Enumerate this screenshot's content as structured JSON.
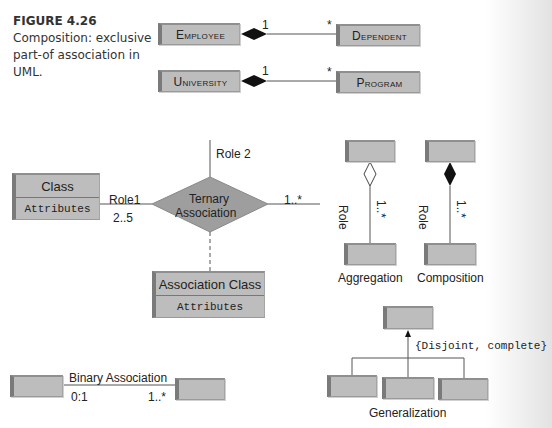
{
  "caption": {
    "figure_label": "FIGURE 4.26",
    "text": "Composition: exclusive part-of association in UML."
  },
  "composition_examples": [
    {
      "whole": "Employee",
      "part": "Dependent",
      "whole_mult": "1",
      "part_mult": "*"
    },
    {
      "whole": "University",
      "part": "Program",
      "whole_mult": "1",
      "part_mult": "*"
    }
  ],
  "ternary": {
    "class_name": "Class",
    "class_attrs": "Attributes",
    "role1": "Role1",
    "role1_mult": "2..5",
    "role2": "Role 2",
    "diamond_label_1": "Ternary",
    "diamond_label_2": "Association",
    "right_mult": "1..*",
    "assoc_class_name": "Association Class",
    "assoc_class_attrs": "Attributes"
  },
  "aggregation": {
    "role": "Role",
    "mult": "1..*",
    "label": "Aggregation"
  },
  "composition": {
    "role": "Role",
    "mult": "1..*",
    "label": "Composition"
  },
  "generalization": {
    "constraint": "{Disjoint, complete}",
    "label": "Generalization"
  },
  "binary": {
    "label": "Binary Association",
    "left_mult": "0:1",
    "right_mult": "1..*"
  }
}
